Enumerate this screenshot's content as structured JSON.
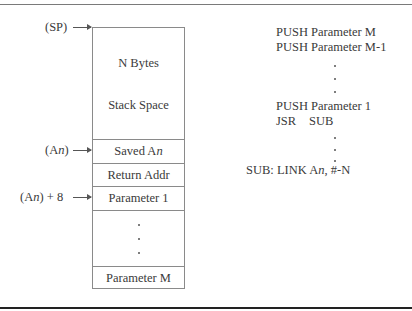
{
  "stack_diagram": {
    "pointers": {
      "sp": "(SP)",
      "an_prefix": "(A",
      "an_suffix": "n",
      "an_close": ")",
      "an8_prefix": "(A",
      "an8_suffix": "n",
      "an8_close": ") + 8"
    },
    "cells": {
      "n_bytes": "N Bytes",
      "stack_space": "Stack Space",
      "saved_an_prefix": "Saved A",
      "saved_an_suffix": "n",
      "return_addr": "Return Addr",
      "parameter_1": "Parameter 1",
      "parameter_m": "Parameter M"
    }
  },
  "code": {
    "line1": "PUSH Parameter M",
    "line2": "PUSH Parameter M-1",
    "line3": "PUSH Parameter 1",
    "jsr_op": "JSR",
    "jsr_arg": "SUB",
    "sub_prefix": "SUB: LINK A",
    "sub_reg": "n",
    "sub_suffix": ", #-N"
  }
}
